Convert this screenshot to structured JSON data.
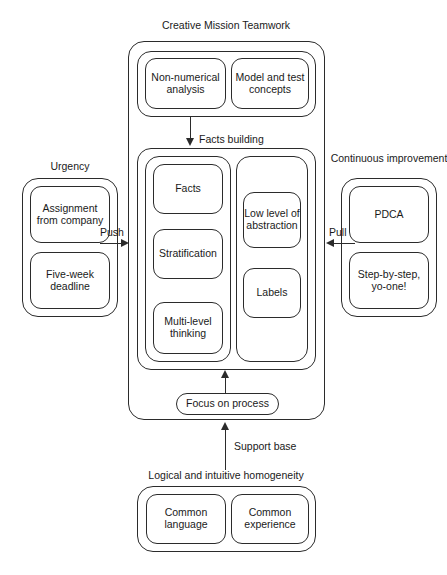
{
  "diagram": {
    "title": "Creative Mission Teamwork",
    "caption": ""
  },
  "top_group": {
    "items": [
      {
        "label": "Non-numerical analysis"
      },
      {
        "label": "Model and test concepts"
      }
    ]
  },
  "flow_labels": {
    "facts_building": "Facts building",
    "push": "Push",
    "pull": "Pull",
    "support_base": "Support base"
  },
  "middle_group": {
    "left_column": {
      "items": [
        {
          "label": "Facts"
        },
        {
          "label": "Stratification"
        },
        {
          "label": "Multi-level thinking"
        }
      ]
    },
    "right_column": {
      "items": [
        {
          "label": "Low level of abstraction"
        },
        {
          "label": "Labels"
        }
      ]
    }
  },
  "focus": {
    "label": "Focus on process"
  },
  "left_group": {
    "title": "Urgency",
    "items": [
      {
        "label": "Assignment from company"
      },
      {
        "label": "Five-week deadline"
      }
    ]
  },
  "right_group": {
    "title": "Continuous improvement",
    "items": [
      {
        "label": "PDCA"
      },
      {
        "label": "Step-by-step, yo-one!"
      }
    ]
  },
  "bottom_group": {
    "title": "Logical and intuitive homogeneity",
    "items": [
      {
        "label": "Common language"
      },
      {
        "label": "Common experience"
      }
    ]
  },
  "colors": {
    "stroke": "#2b2b2b",
    "background": "#ffffff",
    "text": "#1a1a1a"
  }
}
